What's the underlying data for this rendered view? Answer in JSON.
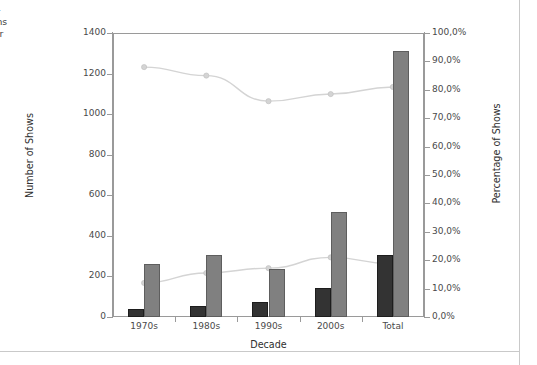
{
  "caption": {
    "lines": [
      "and per-",
      "xhibitions",
      "y gender"
    ]
  },
  "legend": {
    "items": [
      {
        "label": "hows"
      },
      {
        "label": "ws"
      },
      {
        "label": "Shows"
      },
      {
        "label": "hows"
      }
    ]
  },
  "chart_data": {
    "type": "bar",
    "title": "",
    "xlabel": "Decade",
    "ylabel": "Number of Shows",
    "y2label": "Percentage of Shows",
    "categories": [
      "1970s",
      "1980s",
      "1990s",
      "2000s",
      "Total"
    ],
    "ylim": [
      0,
      1400
    ],
    "yticks": [
      0,
      200,
      400,
      600,
      800,
      1000,
      1200,
      1400
    ],
    "ytick_labels": [
      "0",
      "200",
      "400",
      "600",
      "800",
      "1000",
      "1200",
      "1400"
    ],
    "y2lim": [
      0,
      100
    ],
    "y2ticks": [
      0,
      10,
      20,
      30,
      40,
      50,
      60,
      70,
      80,
      90,
      100
    ],
    "y2tick_labels": [
      "0,0%",
      "10,0%",
      "20,0%",
      "30,0%",
      "40,0%",
      "50,0%",
      "60,0%",
      "70,0%",
      "80,0%",
      "90,0%",
      "100,0%"
    ],
    "grid": false,
    "legend_position": "left-outside",
    "bar_series": [
      {
        "name": "hows",
        "axis": "left",
        "color": "#333333",
        "values": [
          40,
          55,
          75,
          145,
          305
        ]
      },
      {
        "name": "ws",
        "axis": "left",
        "color": "#808080",
        "values": [
          260,
          305,
          235,
          520,
          1310
        ]
      }
    ],
    "line_series": [
      {
        "name": "Shows",
        "axis": "right",
        "color": "#d4d4d4",
        "values": [
          88.0,
          85.0,
          76.0,
          78.5,
          81.0
        ]
      },
      {
        "name": "hows",
        "axis": "right",
        "color": "#d4d4d4",
        "values": [
          12.0,
          15.5,
          17.2,
          21.0,
          18.7
        ]
      }
    ]
  }
}
